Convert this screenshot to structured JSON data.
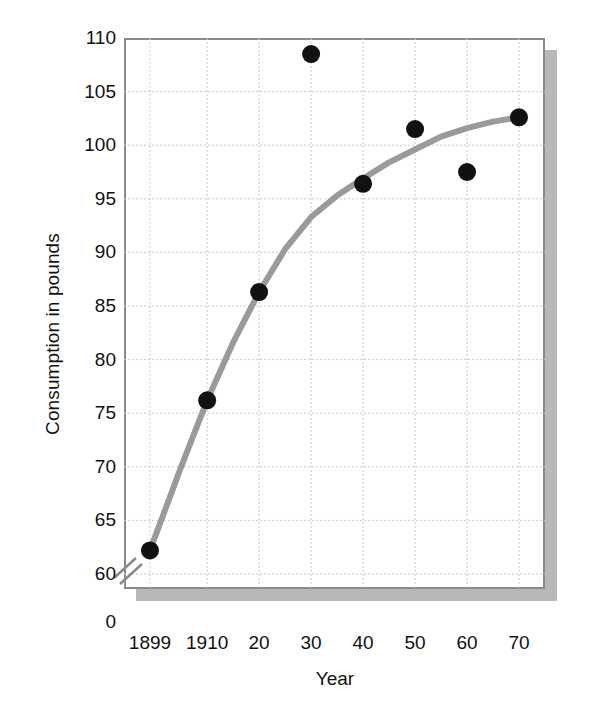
{
  "chart_data": {
    "type": "scatter",
    "title": "",
    "subtitle": "",
    "xlabel": "Year",
    "ylabel": "Consumption in pounds",
    "xtick_labels": [
      "1899",
      "1910",
      "20",
      "30",
      "40",
      "50",
      "60",
      "70"
    ],
    "x": [
      1899,
      1910,
      1920,
      1930,
      1940,
      1950,
      1960,
      1970
    ],
    "values": [
      62.2,
      76.2,
      86.3,
      108.5,
      96.4,
      101.5,
      97.5,
      102.6
    ],
    "ytick_labels": [
      "0",
      "60",
      "65",
      "70",
      "75",
      "80",
      "85",
      "90",
      "95",
      "100",
      "105",
      "110"
    ],
    "ylim": [
      58.6,
      110
    ],
    "y_axis_break": true,
    "y_axis_break_note": "axis broken between 0 and 60",
    "xlim": [
      1894.0,
      1975.0
    ],
    "grid": true,
    "grid_style": "dotted",
    "legend": "none",
    "series": [
      {
        "name": "Consumption in pounds",
        "marker": "filled-circle",
        "marker_color": "#111111",
        "values": [
          62.2,
          76.2,
          86.3,
          108.5,
          96.4,
          101.5,
          97.5,
          102.6
        ]
      },
      {
        "name": "fitted trend curve",
        "type": "line",
        "line_color": "#9a9a9a",
        "points": [
          [
            1899,
            62.2
          ],
          [
            1905,
            70.0
          ],
          [
            1910,
            76.2
          ],
          [
            1915,
            81.6
          ],
          [
            1920,
            86.3
          ],
          [
            1925,
            90.3
          ],
          [
            1930,
            93.3
          ],
          [
            1935,
            95.3
          ],
          [
            1940,
            96.9
          ],
          [
            1945,
            98.4
          ],
          [
            1950,
            99.6
          ],
          [
            1955,
            100.8
          ],
          [
            1960,
            101.6
          ],
          [
            1965,
            102.2
          ],
          [
            1970,
            102.6
          ]
        ]
      }
    ]
  },
  "axis": {
    "x_title": "Year",
    "y_title": "Consumption in pounds"
  },
  "colors": {
    "marker": "#111111",
    "curve": "#9a9a9a",
    "frame": "#8a8a8a",
    "shadow": "#b8b8b8",
    "grid": "#c9c9c9",
    "text": "#111111",
    "background": "#ffffff"
  }
}
